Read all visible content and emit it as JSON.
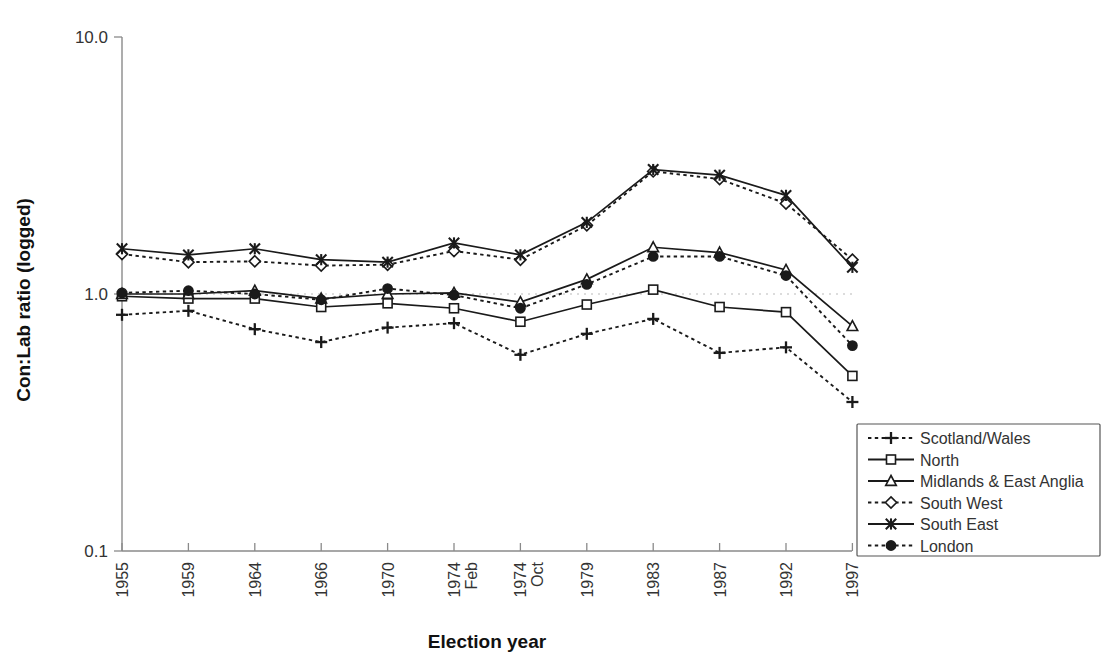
{
  "chart_data": {
    "type": "line",
    "title": "",
    "xlabel": "Election year",
    "ylabel": "Con:Lab ratio (logged)",
    "yscale": "log",
    "ylim": [
      0.1,
      10.0
    ],
    "ytick_labels": [
      "10.0",
      "1.0",
      "0.1"
    ],
    "ytick_values": [
      10.0,
      1.0,
      0.1
    ],
    "grid": "dotted reference line at 1.0",
    "legend_position": "right",
    "categories": [
      "1955",
      "1959",
      "1964",
      "1966",
      "1970",
      "1974 Feb",
      "1974 Oct",
      "1979",
      "1983",
      "1987",
      "1992",
      "1997"
    ],
    "category_lines": [
      [
        "1955"
      ],
      [
        "1959"
      ],
      [
        "1964"
      ],
      [
        "1966"
      ],
      [
        "1970"
      ],
      [
        "1974",
        "Feb"
      ],
      [
        "1974",
        "Oct"
      ],
      [
        "1979"
      ],
      [
        "1983"
      ],
      [
        "1987"
      ],
      [
        "1992"
      ],
      [
        "1997"
      ]
    ],
    "series": [
      {
        "name": "Scotland/Wales",
        "marker": "plus",
        "line": "dotted",
        "values": [
          0.83,
          0.86,
          0.73,
          0.65,
          0.74,
          0.77,
          0.58,
          0.7,
          0.8,
          0.59,
          0.62,
          0.38
        ]
      },
      {
        "name": "North",
        "marker": "square-open",
        "line": "solid",
        "values": [
          0.98,
          0.96,
          0.96,
          0.89,
          0.92,
          0.88,
          0.78,
          0.91,
          1.04,
          0.89,
          0.85,
          0.48
        ]
      },
      {
        "name": "Midlands & East Anglia",
        "marker": "triangle-open",
        "line": "solid",
        "values": [
          1.0,
          1.0,
          1.03,
          0.96,
          1.0,
          1.01,
          0.93,
          1.14,
          1.52,
          1.45,
          1.24,
          0.75
        ]
      },
      {
        "name": "South West",
        "marker": "diamond-open",
        "line": "dotted",
        "values": [
          1.43,
          1.33,
          1.34,
          1.29,
          1.3,
          1.47,
          1.36,
          1.85,
          3.0,
          2.8,
          2.25,
          1.36
        ]
      },
      {
        "name": "South East",
        "marker": "cross-x",
        "line": "solid",
        "values": [
          1.5,
          1.42,
          1.5,
          1.36,
          1.33,
          1.58,
          1.42,
          1.9,
          3.05,
          2.9,
          2.42,
          1.27
        ]
      },
      {
        "name": "London",
        "marker": "circle-filled",
        "line": "dotted",
        "values": [
          1.01,
          1.03,
          1.0,
          0.95,
          1.05,
          0.99,
          0.88,
          1.09,
          1.4,
          1.4,
          1.18,
          0.63
        ]
      }
    ]
  },
  "axes": {
    "y_title": "Con:Lab ratio (logged)",
    "x_title": "Election year",
    "y_labels": [
      "10.0",
      "1.0",
      "0.1"
    ]
  },
  "legend": {
    "entries": [
      {
        "label": "Scotland/Wales"
      },
      {
        "label": "North"
      },
      {
        "label": "Midlands & East Anglia"
      },
      {
        "label": "South West"
      },
      {
        "label": "South East"
      },
      {
        "label": "London"
      }
    ]
  }
}
